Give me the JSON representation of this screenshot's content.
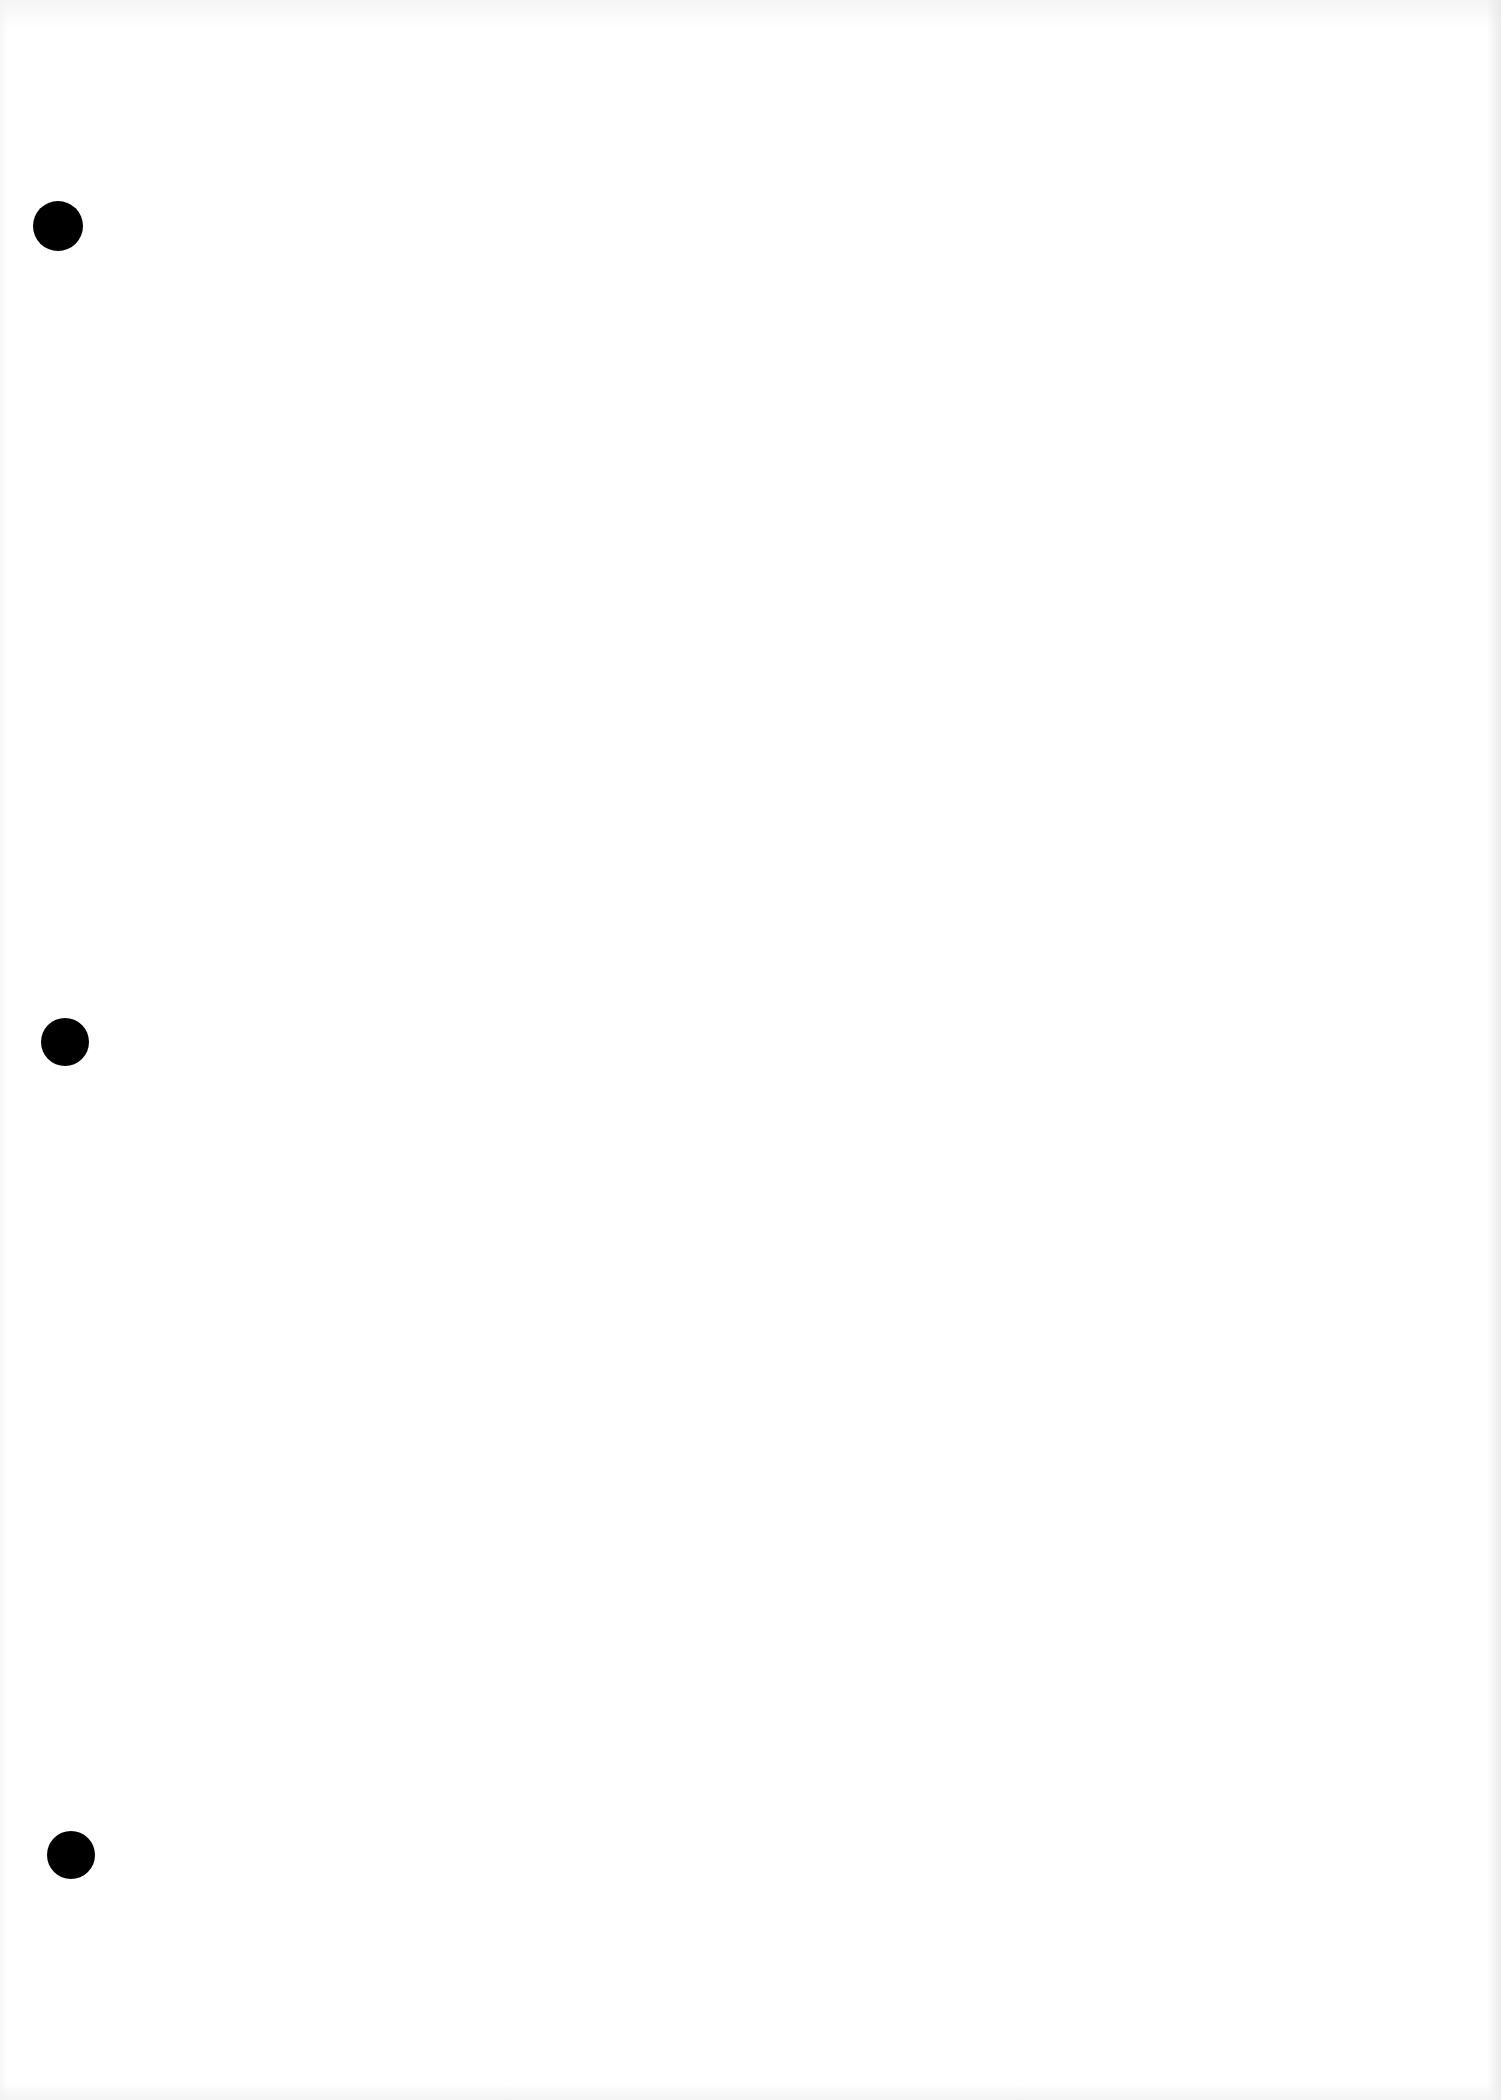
{
  "document": {
    "type": "blank scanned page",
    "background_color": "#ffffff",
    "text": "",
    "punch_holes": [
      {
        "cx": 58,
        "cy": 226,
        "r": 25,
        "color": "#000000"
      },
      {
        "cx": 65,
        "cy": 1042,
        "r": 24,
        "color": "#000000"
      },
      {
        "cx": 71,
        "cy": 1855,
        "r": 24,
        "color": "#000000"
      }
    ]
  }
}
